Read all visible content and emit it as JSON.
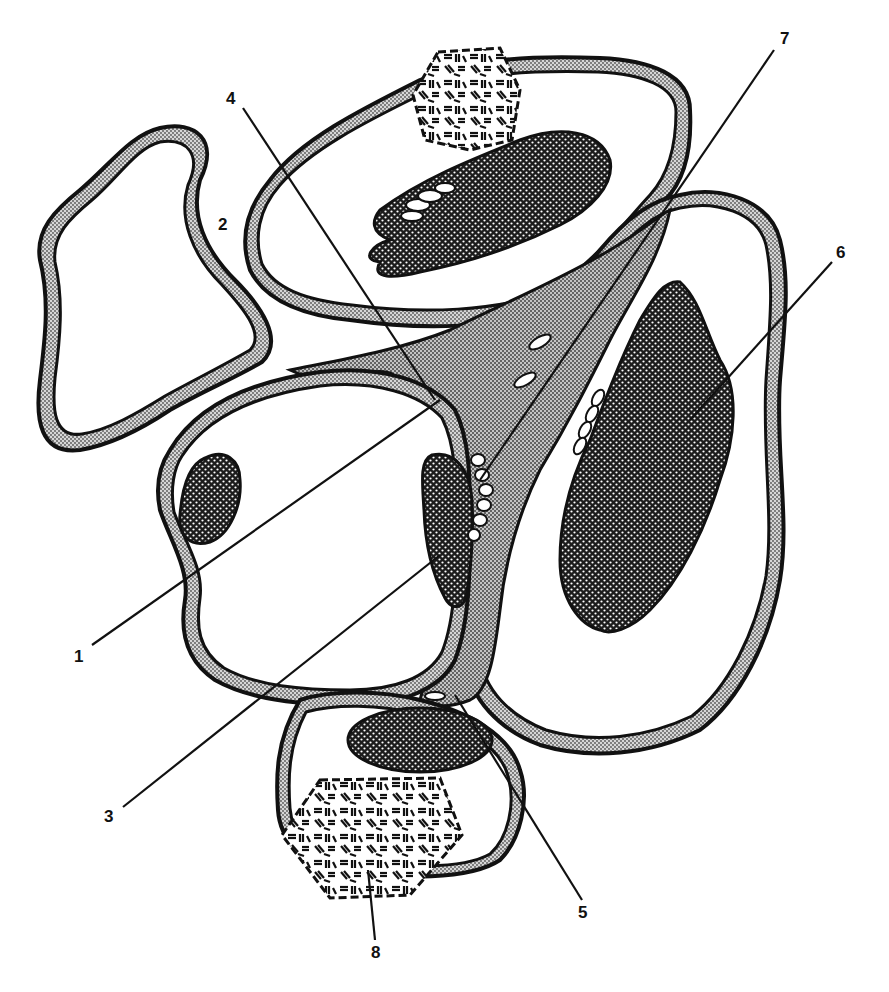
{
  "figure": {
    "type": "schematic histology line drawing",
    "labels": [
      {
        "id": "1",
        "text": "1"
      },
      {
        "id": "2",
        "text": "2"
      },
      {
        "id": "3",
        "text": "3"
      },
      {
        "id": "4",
        "text": "4"
      },
      {
        "id": "5",
        "text": "5"
      },
      {
        "id": "6",
        "text": "6"
      },
      {
        "id": "7",
        "text": "7"
      },
      {
        "id": "8",
        "text": "8"
      }
    ],
    "colors": {
      "outline": "#111111",
      "membrane_stipple": "#b8b8b8",
      "cytoplasm_stipple": "#a9a9a9",
      "nucleus_fill": "#2a2a2a",
      "background": "#ffffff"
    },
    "caption": ""
  }
}
